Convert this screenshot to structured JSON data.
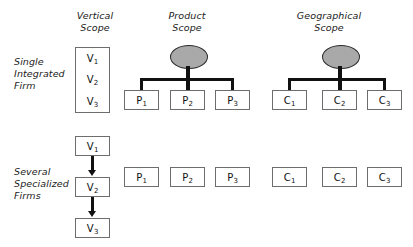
{
  "figure": {
    "columns": [
      {
        "id": "vertical",
        "line1": "Vertical",
        "line2": "Scope"
      },
      {
        "id": "product",
        "line1": "Product",
        "line2": "Scope"
      },
      {
        "id": "geographical",
        "line1": "Geographical",
        "line2": "Scope"
      }
    ],
    "rows": [
      {
        "id": "single-integrated-firm",
        "line1": "Single",
        "line2": "Integrated",
        "line3": "Firm"
      },
      {
        "id": "several-specialized-firms",
        "line1": "Several",
        "line2": "Specialized",
        "line3": "Firms"
      }
    ],
    "nodes": {
      "vertical": [
        {
          "base": "V",
          "sub": "1"
        },
        {
          "base": "V",
          "sub": "2"
        },
        {
          "base": "V",
          "sub": "3"
        }
      ],
      "product": [
        {
          "base": "P",
          "sub": "1"
        },
        {
          "base": "P",
          "sub": "2"
        },
        {
          "base": "P",
          "sub": "3"
        }
      ],
      "geographical": [
        {
          "base": "C",
          "sub": "1"
        },
        {
          "base": "C",
          "sub": "2"
        },
        {
          "base": "C",
          "sub": "3"
        }
      ]
    },
    "colors": {
      "parent_ellipse_fill": "#a9a9a9",
      "parent_ellipse_stroke": "#2b2b2b",
      "box_stroke": "#6d6d6d",
      "connector": "#111111",
      "background": "#ffffff"
    }
  }
}
